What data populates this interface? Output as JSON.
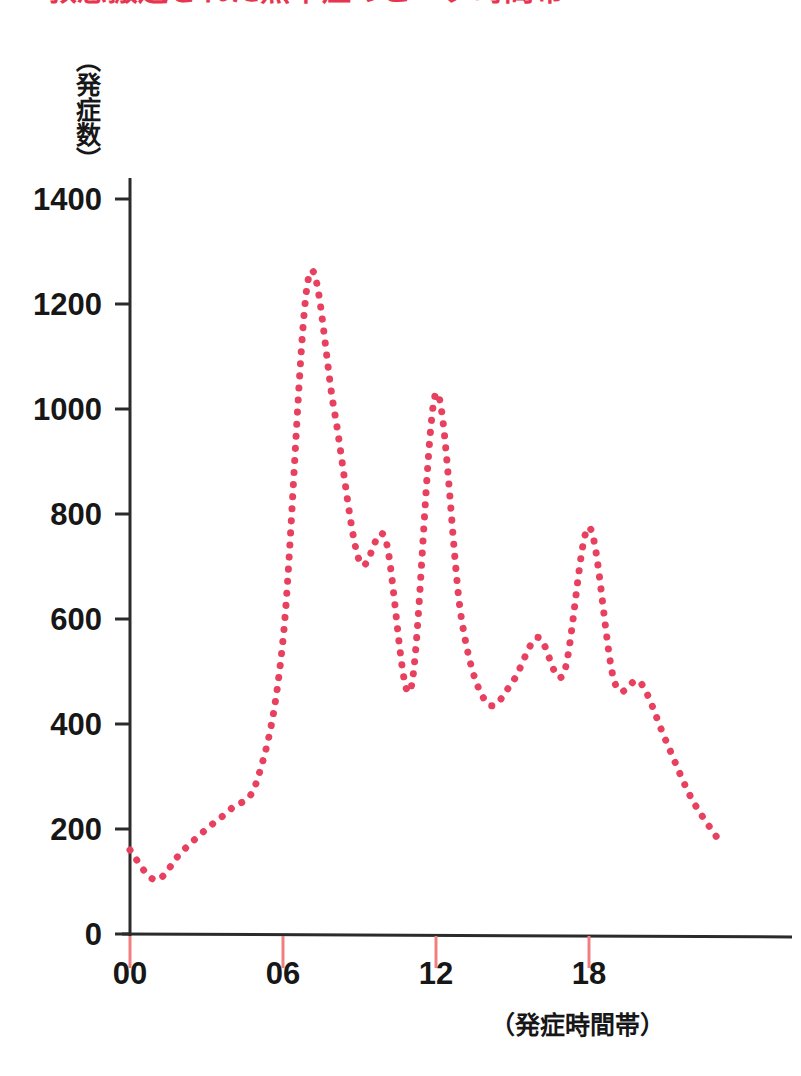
{
  "title": "●救急搬送された熱中症のピーク時間帯",
  "y_axis_caption": "（発症数）",
  "x_axis_caption": "（発症時間帯）",
  "colors": {
    "series": "#e8415f",
    "axis": "#2b2b2b",
    "tick_mark": "#f08080",
    "title": "#e8344e",
    "text": "#171717",
    "background": "#ffffff"
  },
  "y_ticks": [
    "0",
    "200",
    "400",
    "600",
    "800",
    "1000",
    "1200",
    "1400"
  ],
  "x_ticks": [
    "00",
    "06",
    "12",
    "18"
  ],
  "chart_data": {
    "type": "line",
    "title": "●救急搬送された熱中症のピーク時間帯",
    "xlabel": "（発症時間帯）",
    "ylabel": "（発症数）",
    "xlim": [
      0,
      23
    ],
    "ylim": [
      0,
      1500
    ],
    "ytick_values": [
      0,
      200,
      400,
      600,
      800,
      1000,
      1200,
      1400
    ],
    "xtick_values": [
      0,
      6,
      12,
      18
    ],
    "xtick_labels": [
      "00",
      "06",
      "12",
      "18"
    ],
    "grid": false,
    "legend": "none",
    "line_style": "dotted",
    "series": [
      {
        "name": "発症数",
        "color": "#e8415f",
        "x": [
          0,
          1,
          2,
          3,
          4,
          5,
          6,
          7,
          8,
          9,
          10,
          11,
          12,
          13,
          14,
          15,
          16,
          17,
          18,
          19,
          20,
          21,
          22,
          23
        ],
        "values": [
          160,
          103,
          155,
          200,
          240,
          295,
          560,
          1250,
          1000,
          710,
          755,
          465,
          1030,
          600,
          440,
          480,
          565,
          495,
          775,
          480,
          480,
          370,
          260,
          185
        ]
      }
    ]
  }
}
